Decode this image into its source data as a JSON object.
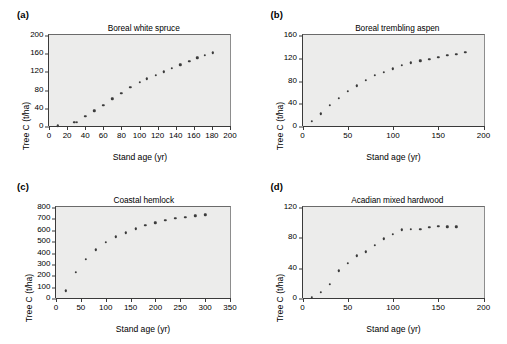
{
  "figure": {
    "background": "#ffffff",
    "plot_background": "#ececeb",
    "marker_color": "#3b3b3b",
    "axis_color": "#3a3a3a"
  },
  "panels": [
    {
      "tag": "(a)",
      "title": "Boreal white spruce",
      "xlabel": "Stand age (yr)",
      "ylabel": "Tree C (t/ha)",
      "xticks": [
        "0",
        "20",
        "40",
        "60",
        "80",
        "100",
        "120",
        "140",
        "160",
        "180",
        "200"
      ],
      "yticks": [
        "0",
        "40",
        "80",
        "120",
        "160",
        "200"
      ]
    },
    {
      "tag": "(b)",
      "title": "Boreal trembling aspen",
      "xlabel": "Stand age (yr)",
      "ylabel": "Tree C (t/ha)",
      "xticks": [
        "0",
        "50",
        "100",
        "150",
        "200"
      ],
      "yticks": [
        "0",
        "40",
        "80",
        "120",
        "160"
      ]
    },
    {
      "tag": "(c)",
      "title": "Coastal hemlock",
      "xlabel": "Stand age (yr)",
      "ylabel": "Tree C (t/ha)",
      "xticks": [
        "0",
        "50",
        "100",
        "150",
        "200",
        "250",
        "300",
        "350"
      ],
      "yticks": [
        "0",
        "100",
        "200",
        "300",
        "400",
        "500",
        "600",
        "700",
        "800"
      ]
    },
    {
      "tag": "(d)",
      "title": "Acadian mixed hardwood",
      "xlabel": "Stand age (yr)",
      "ylabel": "Tree C (t/ha)",
      "xticks": [
        "0",
        "50",
        "100",
        "150",
        "200"
      ],
      "yticks": [
        "0",
        "40",
        "80",
        "120"
      ]
    }
  ],
  "chart_data": [
    {
      "type": "scatter",
      "panel": "(a)",
      "title": "Boreal white spruce",
      "xlabel": "Stand age (yr)",
      "ylabel": "Tree C (t/ha)",
      "xlim": [
        0,
        200
      ],
      "ylim": [
        0,
        200
      ],
      "xtick_interval": 20,
      "ytick_interval": 40,
      "grid": false,
      "legend": "none",
      "x": [
        10,
        28,
        31,
        40,
        50,
        60,
        70,
        80,
        90,
        100,
        110,
        120,
        130,
        140,
        150,
        160,
        170,
        180
      ],
      "y": [
        1,
        8,
        8,
        21,
        34,
        46,
        60,
        72,
        85,
        96,
        104,
        112,
        119,
        127,
        135,
        142,
        150,
        156,
        161
      ],
      "points": [
        {
          "x": 10,
          "y": 1
        },
        {
          "x": 28,
          "y": 8
        },
        {
          "x": 31,
          "y": 8
        },
        {
          "x": 40,
          "y": 21
        },
        {
          "x": 50,
          "y": 34
        },
        {
          "x": 60,
          "y": 46
        },
        {
          "x": 70,
          "y": 60
        },
        {
          "x": 80,
          "y": 72
        },
        {
          "x": 90,
          "y": 85
        },
        {
          "x": 100,
          "y": 96
        },
        {
          "x": 108,
          "y": 104
        },
        {
          "x": 118,
          "y": 112
        },
        {
          "x": 127,
          "y": 119
        },
        {
          "x": 136,
          "y": 127
        },
        {
          "x": 145,
          "y": 135
        },
        {
          "x": 155,
          "y": 142
        },
        {
          "x": 164,
          "y": 150
        },
        {
          "x": 172,
          "y": 156
        },
        {
          "x": 181,
          "y": 161
        }
      ]
    },
    {
      "type": "scatter",
      "panel": "(b)",
      "title": "Boreal trembling aspen",
      "xlabel": "Stand age (yr)",
      "ylabel": "Tree C (t/ha)",
      "xlim": [
        0,
        200
      ],
      "ylim": [
        0,
        160
      ],
      "xtick_interval": 50,
      "ytick_interval": 40,
      "grid": false,
      "legend": "none",
      "x": [
        10,
        20,
        30,
        40,
        50,
        60,
        70,
        80,
        90,
        100,
        110,
        120,
        130,
        140,
        150,
        160,
        170,
        180
      ],
      "y": [
        9,
        22,
        37,
        49,
        61,
        71,
        81,
        89,
        95,
        101,
        107,
        111,
        115,
        118,
        121,
        124,
        126,
        130
      ],
      "points": [
        {
          "x": 10,
          "y": 9
        },
        {
          "x": 20,
          "y": 22
        },
        {
          "x": 30,
          "y": 37
        },
        {
          "x": 40,
          "y": 49
        },
        {
          "x": 50,
          "y": 61
        },
        {
          "x": 60,
          "y": 71
        },
        {
          "x": 70,
          "y": 81
        },
        {
          "x": 80,
          "y": 89
        },
        {
          "x": 90,
          "y": 95
        },
        {
          "x": 100,
          "y": 101
        },
        {
          "x": 110,
          "y": 107
        },
        {
          "x": 120,
          "y": 111
        },
        {
          "x": 130,
          "y": 115
        },
        {
          "x": 140,
          "y": 118
        },
        {
          "x": 150,
          "y": 121
        },
        {
          "x": 160,
          "y": 124
        },
        {
          "x": 170,
          "y": 126
        },
        {
          "x": 180,
          "y": 130
        }
      ]
    },
    {
      "type": "scatter",
      "panel": "(c)",
      "title": "Coastal hemlock",
      "xlabel": "Stand age (yr)",
      "ylabel": "Tree C (t/ha)",
      "xlim": [
        0,
        350
      ],
      "ylim": [
        0,
        800
      ],
      "xtick_interval": 50,
      "ytick_interval": 100,
      "grid": false,
      "legend": "none",
      "x": [
        20,
        40,
        60,
        80,
        100,
        120,
        140,
        160,
        180,
        200,
        220,
        240,
        260,
        280,
        300
      ],
      "y": [
        65,
        225,
        340,
        425,
        492,
        540,
        575,
        610,
        638,
        662,
        683,
        702,
        712,
        722,
        732
      ],
      "points": [
        {
          "x": 20,
          "y": 65
        },
        {
          "x": 40,
          "y": 225
        },
        {
          "x": 60,
          "y": 340
        },
        {
          "x": 80,
          "y": 425
        },
        {
          "x": 100,
          "y": 492
        },
        {
          "x": 120,
          "y": 540
        },
        {
          "x": 140,
          "y": 575
        },
        {
          "x": 160,
          "y": 610
        },
        {
          "x": 180,
          "y": 638
        },
        {
          "x": 200,
          "y": 662
        },
        {
          "x": 220,
          "y": 683
        },
        {
          "x": 240,
          "y": 702
        },
        {
          "x": 260,
          "y": 712
        },
        {
          "x": 280,
          "y": 722
        },
        {
          "x": 300,
          "y": 732
        }
      ]
    },
    {
      "type": "scatter",
      "panel": "(d)",
      "title": "Acadian mixed hardwood",
      "xlabel": "Stand age (yr)",
      "ylabel": "Tree C (t/ha)",
      "xlim": [
        0,
        200
      ],
      "ylim": [
        0,
        120
      ],
      "xtick_interval": 50,
      "ytick_interval": 40,
      "grid": false,
      "legend": "none",
      "x": [
        10,
        20,
        30,
        40,
        50,
        60,
        70,
        80,
        90,
        100,
        110,
        120,
        130,
        140,
        150,
        160,
        170
      ],
      "y": [
        1,
        8,
        18,
        36,
        46,
        56,
        61,
        70,
        78,
        84,
        90,
        91,
        91,
        93,
        95,
        94,
        94
      ],
      "points": [
        {
          "x": 10,
          "y": 1
        },
        {
          "x": 20,
          "y": 8
        },
        {
          "x": 30,
          "y": 18
        },
        {
          "x": 40,
          "y": 36
        },
        {
          "x": 50,
          "y": 46
        },
        {
          "x": 60,
          "y": 56
        },
        {
          "x": 70,
          "y": 61
        },
        {
          "x": 80,
          "y": 70
        },
        {
          "x": 90,
          "y": 78
        },
        {
          "x": 100,
          "y": 84
        },
        {
          "x": 110,
          "y": 90
        },
        {
          "x": 120,
          "y": 91
        },
        {
          "x": 130,
          "y": 91
        },
        {
          "x": 140,
          "y": 93
        },
        {
          "x": 150,
          "y": 95
        },
        {
          "x": 160,
          "y": 94
        },
        {
          "x": 170,
          "y": 94
        }
      ]
    }
  ]
}
